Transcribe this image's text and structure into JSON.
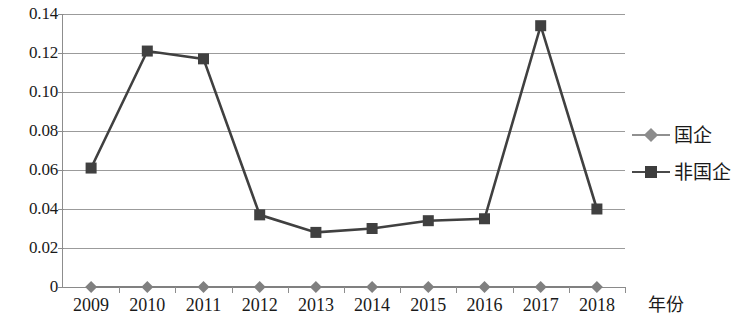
{
  "chart_data": {
    "type": "line",
    "title": "",
    "xlabel": "年份",
    "ylabel": "",
    "categories": [
      "2009",
      "2010",
      "2011",
      "2012",
      "2013",
      "2014",
      "2015",
      "2016",
      "2017",
      "2018"
    ],
    "series": [
      {
        "name": "国企",
        "marker": "diamond",
        "color": "#808080",
        "values": [
          0,
          0,
          0,
          0,
          0,
          0,
          0,
          0,
          0,
          0
        ]
      },
      {
        "name": "非国企",
        "marker": "square",
        "color": "#404040",
        "values": [
          0.061,
          0.121,
          0.117,
          0.037,
          0.028,
          0.03,
          0.034,
          0.035,
          0.134,
          0.04
        ]
      }
    ],
    "ylim": [
      0,
      0.14
    ],
    "ytick_labels": [
      "0.14",
      "0.12",
      "0.10",
      "0.08",
      "0.06",
      "0.04",
      "0.02",
      "0"
    ],
    "ytick_values": [
      0.14,
      0.12,
      0.1,
      0.08,
      0.06,
      0.04,
      0.02,
      0
    ],
    "grid": true,
    "legend_position": "right"
  },
  "legend": {
    "entries": [
      {
        "label": "国企"
      },
      {
        "label": "非国企"
      }
    ]
  },
  "axis": {
    "x_title": "年份"
  }
}
